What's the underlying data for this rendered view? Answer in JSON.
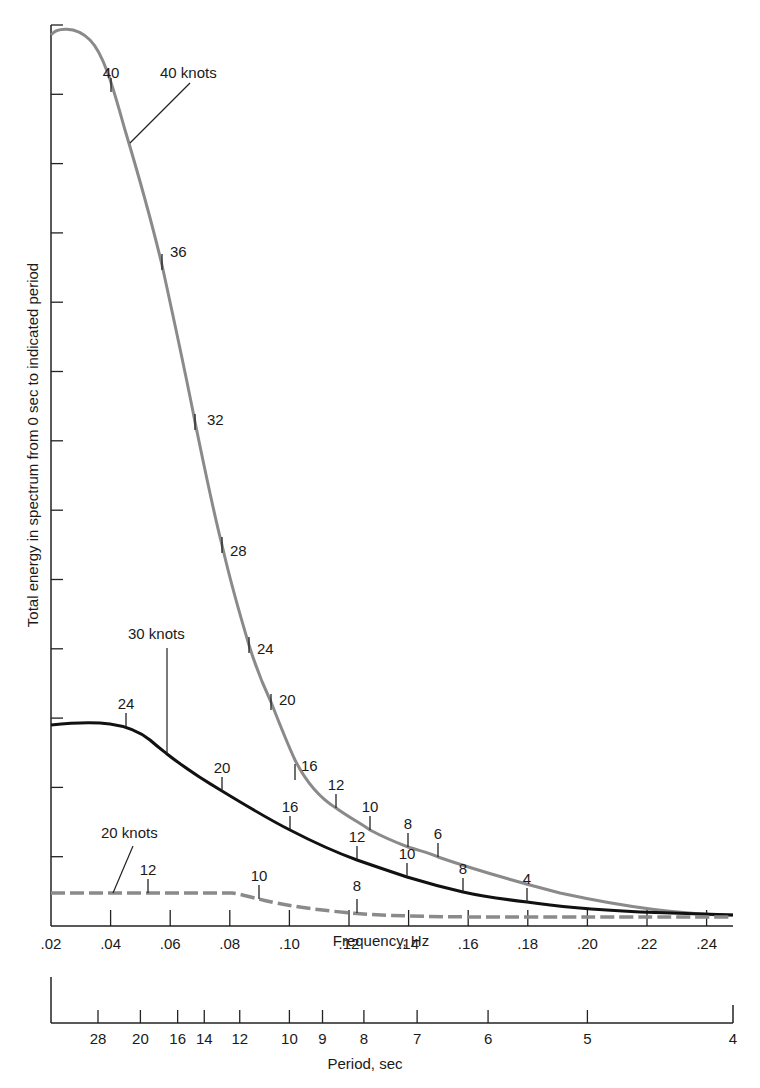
{
  "chart_data": {
    "type": "line",
    "title": "",
    "xlabel": "Frequency, Hz",
    "ylabel": "Total energy in spectrum from 0 sec to indicated period",
    "secondary_xlabel": "Period, sec",
    "xlim": [
      0.02,
      0.25
    ],
    "x_ticks": [
      ".02",
      ".04",
      ".06",
      ".08",
      ".10",
      ".12",
      ".14",
      ".16",
      ".18",
      ".20",
      ".22",
      ".24"
    ],
    "period_ticks": [
      "28",
      "20",
      "16",
      "14",
      "12",
      "10",
      "9",
      "8",
      "7",
      "6",
      "5",
      "4"
    ],
    "y_ticks_count": 13,
    "y_tick_labels": [],
    "grid": false,
    "legend": "none (curves labelled directly)",
    "series": [
      {
        "name": "40 knots",
        "style": "gray solid",
        "x": [
          0.02,
          0.025,
          0.04,
          0.047,
          0.058,
          0.069,
          0.078,
          0.087,
          0.094,
          0.102,
          0.115,
          0.127,
          0.14,
          0.15,
          0.18,
          0.21,
          0.25
        ],
        "y_rel": [
          12.5,
          12.7,
          11.95,
          11.3,
          9.5,
          7.25,
          5.55,
          4.0,
          3.24,
          2.5,
          1.76,
          1.43,
          1.15,
          0.97,
          0.62,
          0.38,
          0.08
        ],
        "period_marks": [
          {
            "label": "40",
            "x": 0.04
          },
          {
            "label": "36",
            "x": 0.058
          },
          {
            "label": "32",
            "x": 0.069
          },
          {
            "label": "28",
            "x": 0.078
          },
          {
            "label": "24",
            "x": 0.087
          },
          {
            "label": "20",
            "x": 0.094
          },
          {
            "label": "16",
            "x": 0.102
          },
          {
            "label": "12",
            "x": 0.115
          },
          {
            "label": "10",
            "x": 0.127
          },
          {
            "label": "8",
            "x": 0.14
          },
          {
            "label": "6",
            "x": 0.15
          }
        ]
      },
      {
        "name": "30 knots",
        "style": "black solid",
        "x": [
          0.02,
          0.03,
          0.045,
          0.053,
          0.058,
          0.077,
          0.1,
          0.122,
          0.139,
          0.159,
          0.178,
          0.2,
          0.25
        ],
        "y_rel": [
          2.88,
          2.9,
          2.85,
          2.55,
          2.43,
          1.9,
          1.37,
          0.95,
          0.69,
          0.46,
          0.3,
          0.2,
          0.1
        ],
        "period_marks": [
          {
            "label": "24",
            "x": 0.045
          },
          {
            "label": "20",
            "x": 0.077
          },
          {
            "label": "16",
            "x": 0.1
          },
          {
            "label": "12",
            "x": 0.122
          },
          {
            "label": "10",
            "x": 0.139
          },
          {
            "label": "8",
            "x": 0.159
          },
          {
            "label": "4",
            "x": 0.178
          }
        ]
      },
      {
        "name": "20 knots",
        "style": "gray dashed",
        "x": [
          0.02,
          0.04,
          0.08,
          0.09,
          0.1,
          0.12,
          0.15,
          0.2,
          0.25
        ],
        "y_rel": [
          0.47,
          0.47,
          0.47,
          0.4,
          0.3,
          0.2,
          0.14,
          0.12,
          0.08
        ],
        "period_marks": [
          {
            "label": "12",
            "x": 0.053
          },
          {
            "label": "10",
            "x": 0.09
          },
          {
            "label": "8",
            "x": 0.122
          }
        ]
      }
    ],
    "annotations": [
      "40 knots",
      "30 knots",
      "20 knots"
    ]
  },
  "labels": {
    "xlabel": "Frequency, Hz",
    "ylabel": "Total energy in spectrum from 0 sec to indicated period",
    "period_label": "Period, sec",
    "knots40": "40 knots",
    "knots30": "30 knots",
    "knots20": "20 knots"
  },
  "colors": {
    "gray_curve": "#8a8a8a",
    "black_curve": "#111111",
    "axis": "#222222"
  }
}
